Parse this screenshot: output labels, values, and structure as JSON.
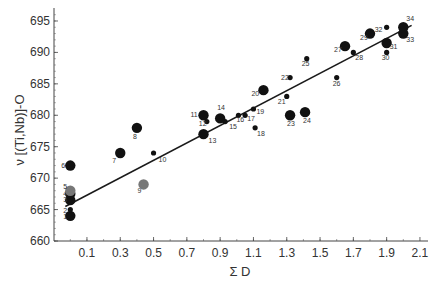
{
  "chart_data": {
    "type": "scatter",
    "title": "",
    "xlabel": "Σ D",
    "ylabel": "ν [(Ti,Nb)]-O",
    "xlim": [
      -0.1,
      2.2
    ],
    "ylim": [
      660,
      697
    ],
    "x_ticks": [
      "0.1",
      "0.3",
      "0.5",
      "0.7",
      "0.9",
      "1.1",
      "1.3",
      "1.5",
      "1.7",
      "1.9",
      "2.1"
    ],
    "y_ticks": [
      "660",
      "665",
      "670",
      "675",
      "680",
      "685",
      "690",
      "695"
    ],
    "grid": false,
    "legend": null,
    "trendline": {
      "x": [
        -0.03,
        2.05
      ],
      "y": [
        665.5,
        694.3
      ]
    },
    "points": [
      {
        "id": "1",
        "x": 0.0,
        "y": 664.0,
        "size": "large"
      },
      {
        "id": "2",
        "x": 0.0,
        "y": 665.0,
        "size": "small"
      },
      {
        "id": "3",
        "x": 0.0,
        "y": 666.5,
        "size": "large"
      },
      {
        "id": "4",
        "x": 0.0,
        "y": 667.5,
        "size": "large"
      },
      {
        "id": "5",
        "x": 0.0,
        "y": 668.0,
        "size": "large",
        "shade": "gray"
      },
      {
        "id": "6",
        "x": 0.0,
        "y": 672.0,
        "size": "large"
      },
      {
        "id": "7",
        "x": 0.3,
        "y": 674.0,
        "size": "large"
      },
      {
        "id": "8",
        "x": 0.4,
        "y": 678.0,
        "size": "large"
      },
      {
        "id": "9",
        "x": 0.44,
        "y": 669.0,
        "size": "large",
        "shade": "gray"
      },
      {
        "id": "10",
        "x": 0.5,
        "y": 674.0,
        "size": "small"
      },
      {
        "id": "11",
        "x": 0.8,
        "y": 680.0,
        "size": "large"
      },
      {
        "id": "12",
        "x": 0.82,
        "y": 679.0,
        "size": "small"
      },
      {
        "id": "13",
        "x": 0.8,
        "y": 677.0,
        "size": "large"
      },
      {
        "id": "14",
        "x": 0.9,
        "y": 679.5,
        "size": "large"
      },
      {
        "id": "15",
        "x": 0.93,
        "y": 679.0,
        "size": "small"
      },
      {
        "id": "16",
        "x": 1.01,
        "y": 680.0,
        "size": "small"
      },
      {
        "id": "17",
        "x": 1.05,
        "y": 680.0,
        "size": "small"
      },
      {
        "id": "18",
        "x": 1.11,
        "y": 678.0,
        "size": "small"
      },
      {
        "id": "19",
        "x": 1.1,
        "y": 681.0,
        "size": "small"
      },
      {
        "id": "20",
        "x": 1.16,
        "y": 684.0,
        "size": "large"
      },
      {
        "id": "21",
        "x": 1.3,
        "y": 683.0,
        "size": "small"
      },
      {
        "id": "22",
        "x": 1.32,
        "y": 686.0,
        "size": "small"
      },
      {
        "id": "23",
        "x": 1.32,
        "y": 680.0,
        "size": "large"
      },
      {
        "id": "24",
        "x": 1.41,
        "y": 680.5,
        "size": "large"
      },
      {
        "id": "25",
        "x": 1.42,
        "y": 689.0,
        "size": "small"
      },
      {
        "id": "26",
        "x": 1.6,
        "y": 686.0,
        "size": "small"
      },
      {
        "id": "27",
        "x": 1.65,
        "y": 691.0,
        "size": "large"
      },
      {
        "id": "28",
        "x": 1.7,
        "y": 690.0,
        "size": "small"
      },
      {
        "id": "29",
        "x": 1.8,
        "y": 693.0,
        "size": "large"
      },
      {
        "id": "30",
        "x": 1.9,
        "y": 690.0,
        "size": "small"
      },
      {
        "id": "31",
        "x": 1.9,
        "y": 691.5,
        "size": "large"
      },
      {
        "id": "32",
        "x": 1.9,
        "y": 694.0,
        "size": "small"
      },
      {
        "id": "33",
        "x": 2.0,
        "y": 693.0,
        "size": "large"
      },
      {
        "id": "34",
        "x": 2.0,
        "y": 694.0,
        "size": "large"
      }
    ]
  },
  "colors": {
    "point": "#111111",
    "point_gray": "#777777",
    "axis": "#444444",
    "line": "#1a1a1a",
    "text": "#333333"
  }
}
